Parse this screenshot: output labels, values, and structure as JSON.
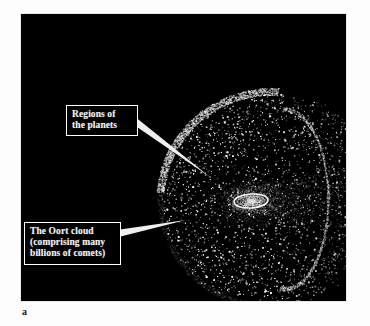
{
  "figure": {
    "panel_letter": "a",
    "background_color": "#ffffff",
    "plate_color": "#000000",
    "plate": {
      "x": 21,
      "y": 14,
      "width": 325,
      "height": 287
    }
  },
  "callouts": [
    {
      "name": "regions-of-the-planets",
      "lines": [
        "Regions of",
        "the planets"
      ],
      "box": {
        "x": 45,
        "y": 91,
        "width": 72
      },
      "text_color": "#f2f2f2",
      "border_color": "#ffffff",
      "fill_color": "#000000",
      "leader": {
        "from_x": 117,
        "from_y": 108,
        "to_x": 210,
        "to_y": 177
      }
    },
    {
      "name": "the-oort-cloud",
      "lines": [
        "The Oort cloud",
        "(comprising many",
        "billions of comets)"
      ],
      "box": {
        "x": 3,
        "y": 208,
        "width": 97
      },
      "text_color": "#f2f2f2",
      "border_color": "#ffffff",
      "fill_color": "#000000",
      "leader": {
        "from_x": 100,
        "from_y": 237,
        "to_x": 186,
        "to_y": 220
      }
    }
  ],
  "scene": {
    "description": "Oort cloud sphere of comets surrounding the planetary region",
    "oort_sphere": {
      "center_x": 250,
      "center_y": 185,
      "radius": 112
    },
    "planetary_disk": {
      "center_x": 230,
      "center_y": 187,
      "rx": 17,
      "ry": 7
    },
    "comet_count": 5200,
    "comet_color": "#ffffff",
    "outer_arc_color": "#b9b9b9",
    "inner_arc_color": "#8f8f8f"
  }
}
